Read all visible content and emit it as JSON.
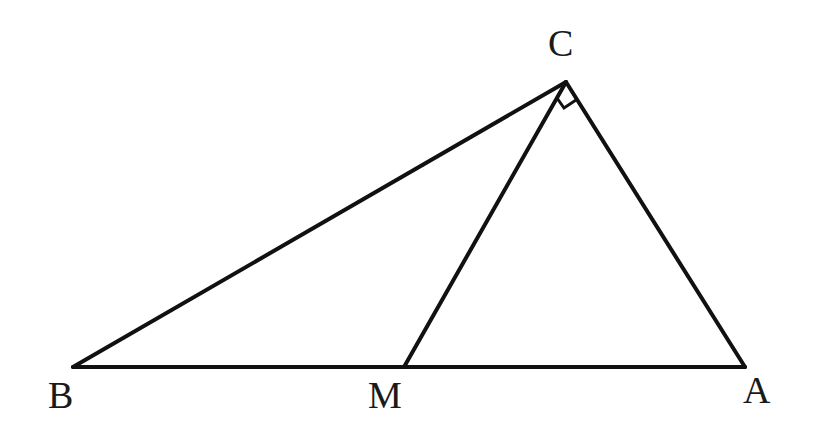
{
  "diagram": {
    "type": "geometry-triangle",
    "stroke_color": "#111111",
    "points": {
      "B": {
        "label": "B",
        "x": 73,
        "y": 367
      },
      "M": {
        "label": "M",
        "x": 404,
        "y": 367
      },
      "A": {
        "label": "A",
        "x": 745,
        "y": 367
      },
      "C": {
        "label": "C",
        "x": 566,
        "y": 82
      }
    },
    "segments": [
      "BC",
      "CA",
      "AB",
      "CM"
    ],
    "right_angle_at": "C",
    "right_angle_between": [
      "CM",
      "CA"
    ]
  }
}
